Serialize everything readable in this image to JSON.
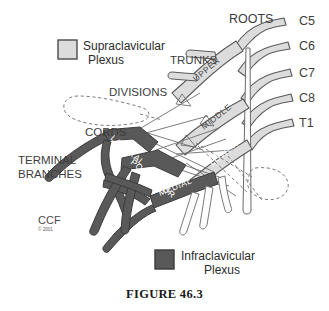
{
  "figure": {
    "caption": "FIGURE 46.3"
  },
  "colors": {
    "background": "#ffffff",
    "supraclavicular_fill": "#dcdcdc",
    "infraclavicular_fill": "#595959",
    "nerve_outline": "#4a4a4a",
    "white_nerve_fill": "#fdfdfd",
    "label_text": "#3d3d3d",
    "white_label_text": "#ffffff",
    "dashed_line": "#6e6e6e"
  },
  "legend": [
    {
      "id": "supraclavicular",
      "label_line1": "Supraclavicular",
      "label_line2": "Plexus",
      "swatch": "#dcdcdc"
    },
    {
      "id": "infraclavicular",
      "label_line1": "Infraclavicular",
      "label_line2": "Plexus",
      "swatch": "#595959"
    }
  ],
  "section_labels": {
    "roots": "ROOTS",
    "trunks": "TRUNKS",
    "divisions": "DIVISIONS",
    "cords": "CORDS",
    "terminal_branches_line1": "TERMINAL",
    "terminal_branches_line2": "BRANCHES"
  },
  "roots": [
    {
      "id": "c5",
      "label": "C5"
    },
    {
      "id": "c6",
      "label": "C6"
    },
    {
      "id": "c7",
      "label": "C7"
    },
    {
      "id": "c8",
      "label": "C8"
    },
    {
      "id": "t1",
      "label": "T1"
    }
  ],
  "trunks": [
    {
      "id": "upper",
      "label": "UPPER"
    },
    {
      "id": "middle",
      "label": "MIDDLE"
    },
    {
      "id": "lower",
      "label": "LOWER"
    }
  ],
  "cords": [
    {
      "id": "lateral",
      "label": "LATERAL"
    },
    {
      "id": "posterior",
      "label": "POSTERIOR"
    },
    {
      "id": "medial",
      "label": "MEDIAL"
    }
  ],
  "credit": {
    "initials": "CCF",
    "copyright": "© 2001"
  }
}
